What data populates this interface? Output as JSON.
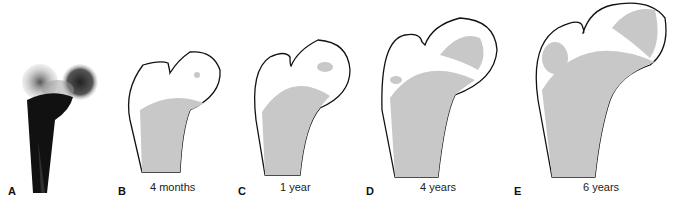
{
  "panels": [
    {
      "letter": "A",
      "caption": ""
    },
    {
      "letter": "B",
      "caption": "4 months"
    },
    {
      "letter": "C",
      "caption": "1 year"
    },
    {
      "letter": "D",
      "caption": "4 years"
    },
    {
      "letter": "E",
      "caption": "6 years"
    }
  ],
  "colors": {
    "ossified": "#c8c8c8",
    "outline": "#111111",
    "radiograph": "#1a1a1a"
  }
}
